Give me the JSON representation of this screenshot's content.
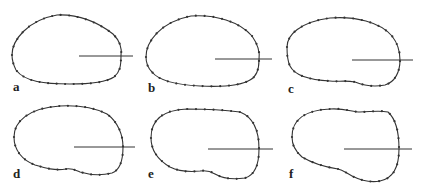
{
  "figure": {
    "panels": [
      {
        "label": "a",
        "label_pos": [
          13,
          80
        ],
        "outline": "M12,55 C12,40 28,20 57,15 C80,14 100,24 113,34 C121,42 122,50 121,56 C121,66 120,72 114,77 C105,83 88,84 70,84 C45,84 25,82 16,70 C13,64 12,60 12,55 Z",
        "ray": [
          79,
          56,
          133,
          56
        ]
      },
      {
        "label": "b",
        "label_pos": [
          148,
          81
        ],
        "outline": "M146,57 C146,42 160,22 191,16 C215,14 240,22 252,36 C259,46 260,54 259,60 C259,70 256,77 250,80 C240,86 220,87 200,86 C180,85 160,82 152,72 C147,67 146,62 146,57 Z",
        "ray": [
          215,
          59,
          272,
          59
        ]
      },
      {
        "label": "c",
        "label_pos": [
          288,
          82
        ],
        "outline": "M287,47 C287,35 300,22 330,18 C355,16 380,22 392,36 C399,45 400,54 400,60 C400,72 395,82 385,85 C375,87 365,86 355,82 C345,80 338,82 330,81 C310,80 295,76 290,66 C287,60 287,53 287,47 Z",
        "ray": [
          352,
          60,
          413,
          60
        ]
      },
      {
        "label": "d",
        "label_pos": [
          13,
          167
        ],
        "outline": "M14,137 C14,122 28,108 60,106 C80,105 95,108 107,114 C118,122 123,135 123,147 C123,160 120,170 112,173 C100,176 90,175 80,172 C75,170 72,168 66,169 C55,171 45,168 35,165 C22,160 14,150 14,137 Z",
        "ray": [
          74,
          147,
          135,
          147
        ]
      },
      {
        "label": "e",
        "label_pos": [
          148,
          167
        ],
        "outline": "M151,138 C151,120 162,110 187,109 C205,109 225,110 240,112 C255,118 259,132 259,149 C259,165 255,175 245,178 C232,180 222,178 215,174 C210,171 206,170 200,171 C190,172 180,172 170,167 C158,160 151,150 151,138 Z",
        "ray": [
          208,
          149,
          273,
          149
        ]
      },
      {
        "label": "f",
        "label_pos": [
          289,
          167
        ],
        "outline": "M292,137 C292,120 305,110 330,109 C345,108 352,112 360,112 C370,112 378,110 388,112 C397,120 399,135 399,149 C399,165 395,178 380,181 C370,183 360,180 352,176 C346,173 343,170 338,169 C325,167 312,163 302,157 C295,151 292,145 292,137 Z",
        "ray": [
          344,
          149,
          412,
          149
        ]
      }
    ]
  }
}
